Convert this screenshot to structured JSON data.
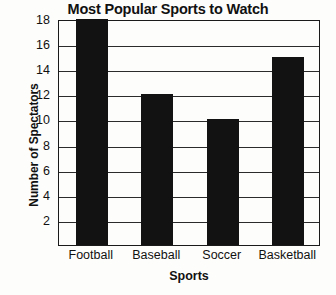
{
  "chart_data": {
    "type": "bar",
    "title": "Most Popular Sports to Watch",
    "xlabel": "Sports",
    "ylabel": "Number of Spectators",
    "categories": [
      "Football",
      "Baseball",
      "Soccer",
      "Basketball"
    ],
    "values": [
      18,
      12,
      10,
      15
    ],
    "ylim": [
      0,
      18
    ],
    "ytick_step": 2,
    "yticks": [
      18,
      16,
      14,
      12,
      10,
      8,
      6,
      4,
      2
    ],
    "grid": "horizontal",
    "legend": "none",
    "bar_color": "#121212",
    "background_color": "#fdfdfb",
    "axis_color": "#1a1a1a"
  }
}
